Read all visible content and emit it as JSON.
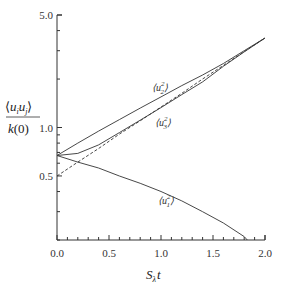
{
  "chart_data": {
    "type": "line",
    "title": "",
    "xlabel": "S_λ t",
    "ylabel": "⟨u_i u_j⟩ / k(0)",
    "yscale": "log",
    "xlim": [
      0.0,
      2.0
    ],
    "ylim": [
      0.2,
      5.0
    ],
    "grid": false,
    "legend": "inline labels",
    "x_ticks": [
      "0.0",
      "0.5",
      "1.0",
      "1.5",
      "2.0"
    ],
    "y_ticks": [
      "0.5",
      "1.0",
      "5.0"
    ],
    "x": [
      0.0,
      0.2,
      0.4,
      0.6,
      0.8,
      1.0,
      1.2,
      1.4,
      1.6,
      1.8,
      2.0
    ],
    "series": [
      {
        "name": "⟨u_2^2⟩",
        "style": "solid",
        "values": [
          0.67,
          0.8,
          0.95,
          1.12,
          1.32,
          1.55,
          1.82,
          2.12,
          2.5,
          3.0,
          3.6
        ]
      },
      {
        "name": "⟨u_3^2⟩",
        "style": "solid",
        "values": [
          0.67,
          0.69,
          0.78,
          0.93,
          1.11,
          1.33,
          1.6,
          1.92,
          2.4,
          2.95,
          3.6
        ]
      },
      {
        "name": "exponential reference",
        "style": "dashed",
        "values": [
          0.5,
          0.61,
          0.74,
          0.91,
          1.1,
          1.34,
          1.63,
          2.0,
          2.43,
          2.96,
          3.6
        ]
      },
      {
        "name": "⟨u_1^2⟩",
        "style": "solid",
        "values": [
          0.67,
          0.61,
          0.56,
          0.5,
          0.45,
          0.4,
          0.35,
          0.3,
          0.255,
          0.21,
          null
        ]
      }
    ]
  },
  "labels": {
    "y_num": "⟨u",
    "y_den": "k(0)",
    "x_title_S": "S",
    "x_title_sub": "λ",
    "x_title_t": "t",
    "u2": "u",
    "u3": "u",
    "u1": "u"
  }
}
